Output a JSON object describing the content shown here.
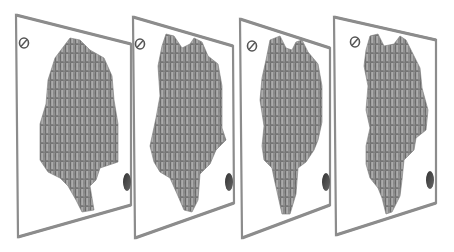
{
  "figure": {
    "background": "#ffffff",
    "frame_color": "#8c8c8c",
    "pin_color": "#8a8a8a",
    "pin_highlight": "#b4b4b4",
    "pin_shadow": "#6a6a6a",
    "marker_top_color": "#ffffff",
    "marker_bottom_color": "#4a4a4a"
  },
  "panels": [
    {
      "index": 1,
      "frame": [
        [
          16,
          15
        ],
        [
          131,
          44
        ],
        [
          131,
          205
        ],
        [
          18,
          237
        ]
      ],
      "shape": "M 55 58 L 70 38 L 80 40 L 90 50 L 104 58 L 112 76 L 114 100 L 118 124 L 118 162 L 100 168 L 96 180 L 90 186 L 94 210 L 82 212 L 76 200 L 68 186 L 60 178 L 48 172 L 40 160 L 40 124 L 46 104 L 48 80 Z",
      "top_marker": [
        24,
        43
      ],
      "bottom_marker": [
        127,
        182
      ]
    },
    {
      "index": 2,
      "frame": [
        [
          133,
          17
        ],
        [
          233,
          46
        ],
        [
          234,
          203
        ],
        [
          135,
          238
        ]
      ],
      "shape": "M 162 46 L 166 34 L 174 36 L 182 48 L 190 44 L 194 38 L 202 42 L 208 56 L 218 64 L 222 86 L 222 128 L 226 140 L 216 150 L 210 164 L 200 174 L 198 200 L 192 212 L 184 210 L 178 196 L 170 178 L 160 172 L 154 162 L 150 146 L 156 118 L 160 96 L 158 66 Z",
      "top_marker": [
        140,
        44
      ],
      "bottom_marker": [
        229,
        182
      ]
    },
    {
      "index": 3,
      "frame": [
        [
          240,
          19
        ],
        [
          330,
          48
        ],
        [
          330,
          205
        ],
        [
          242,
          238
        ]
      ],
      "shape": "M 266 60 L 270 40 L 280 36 L 286 48 L 292 50 L 296 42 L 302 40 L 308 52 L 318 64 L 322 86 L 322 122 L 318 140 L 314 150 L 306 162 L 298 168 L 296 194 L 290 214 L 282 214 L 278 196 L 274 178 L 272 168 L 264 160 L 262 146 L 264 126 L 260 100 L 262 78 Z",
      "top_marker": [
        252,
        46
      ],
      "bottom_marker": [
        326,
        182
      ]
    },
    {
      "index": 4,
      "frame": [
        [
          334,
          17
        ],
        [
          436,
          40
        ],
        [
          436,
          203
        ],
        [
          336,
          235
        ]
      ],
      "shape": "M 366 50 L 370 36 L 378 34 L 384 46 L 394 44 L 400 36 L 406 40 L 414 56 L 420 68 L 422 88 L 428 110 L 426 130 L 416 138 L 414 150 L 404 160 L 402 180 L 400 196 L 392 212 L 386 214 L 382 198 L 378 188 L 370 178 L 366 164 L 366 146 L 370 128 L 366 110 L 368 86 L 364 66 Z",
      "top_marker": [
        355,
        42
      ],
      "bottom_marker": [
        430,
        180
      ]
    }
  ]
}
